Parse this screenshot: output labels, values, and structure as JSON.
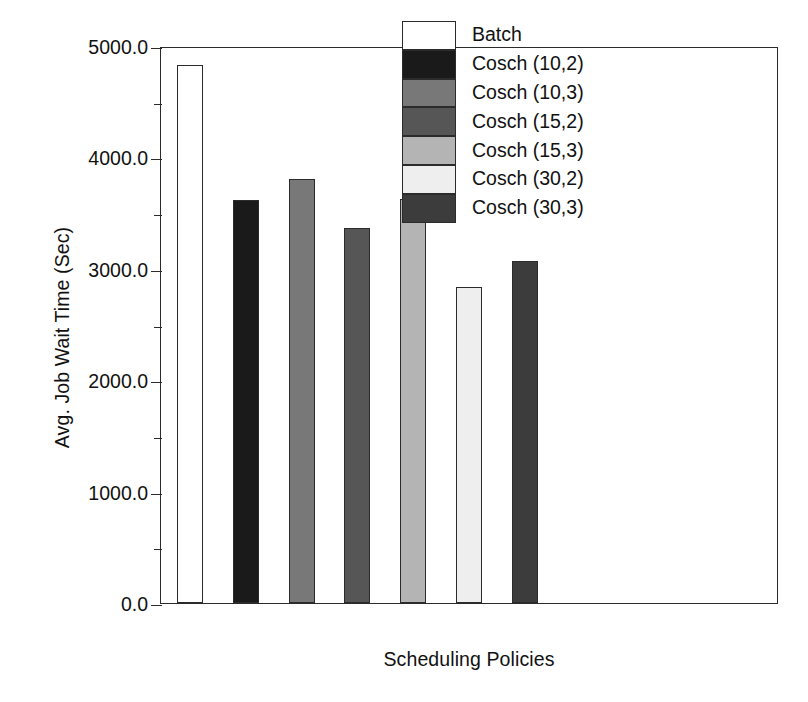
{
  "chart_data": {
    "type": "bar",
    "title": "",
    "xlabel": "Scheduling Policies",
    "ylabel": "Avg. Job Wait Time (Sec)",
    "categories": [
      "Batch",
      "Cosch (10,2)",
      "Cosch (10,3)",
      "Cosch (15,2)",
      "Cosch (15,3)",
      "Cosch (30,2)",
      "Cosch (30,3)"
    ],
    "values": [
      4830,
      3615,
      3810,
      3365,
      3630,
      2835,
      3070
    ],
    "bar_colors": [
      "#ffffff",
      "#1a1a1a",
      "#787878",
      "#565656",
      "#b4b4b4",
      "#eeeeee",
      "#3c3c3c"
    ],
    "ylim": [
      0,
      5000
    ],
    "ytick_values": [
      0,
      1000,
      2000,
      3000,
      4000,
      5000
    ],
    "ytick_labels": [
      "0.0",
      "1000.0",
      "2000.0",
      "3000.0",
      "4000.0",
      "5000.0"
    ],
    "yminor_tick_values": [
      500,
      1500,
      2500,
      3500,
      4500
    ],
    "grid": false,
    "legend_position": "top-right",
    "legend_entries": [
      {
        "label": "Batch",
        "color": "#ffffff"
      },
      {
        "label": "Cosch (10,2)",
        "color": "#1a1a1a"
      },
      {
        "label": "Cosch (10,3)",
        "color": "#787878"
      },
      {
        "label": "Cosch (15,2)",
        "color": "#565656"
      },
      {
        "label": "Cosch (15,3)",
        "color": "#b4b4b4"
      },
      {
        "label": "Cosch (30,2)",
        "color": "#eeeeee"
      },
      {
        "label": "Cosch (30,3)",
        "color": "#3c3c3c"
      }
    ]
  },
  "axis": {
    "frame_color": "#2b2b2b",
    "background": "#ffffff"
  }
}
